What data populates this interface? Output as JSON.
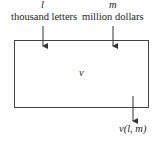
{
  "inputs": [
    {
      "symbol": "l",
      "unit": "thousand letters"
    },
    {
      "symbol": "m",
      "unit": "million dollars"
    }
  ],
  "box": {
    "label": "v"
  },
  "output": {
    "label": "v(l, m)"
  },
  "colors": {
    "line": "#333333",
    "background": "#ffffff"
  }
}
